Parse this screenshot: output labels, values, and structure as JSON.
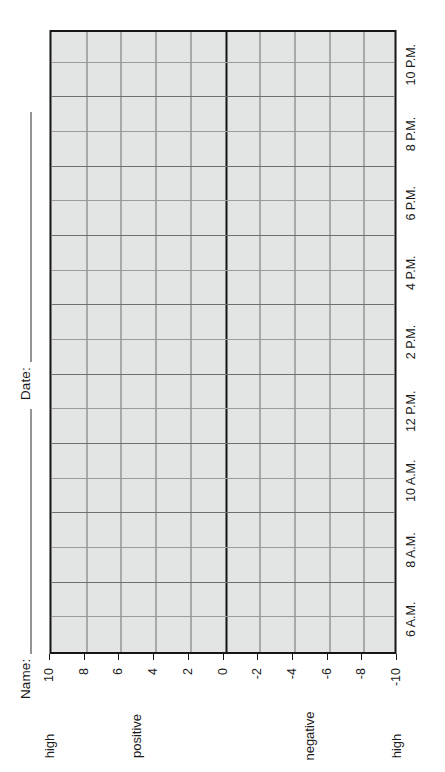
{
  "header": {
    "name_label": "Name:",
    "date_label": "Date:"
  },
  "chart_data": {
    "type": "table",
    "title": "",
    "subtitle": "",
    "xlabel": "",
    "ylabel": "",
    "grid": true,
    "legend": "none",
    "value_axis": {
      "label_positive": "positive",
      "label_negative": "negative",
      "high_label_top": "high",
      "high_label_bottom": "high",
      "ticks": [
        10,
        8,
        6,
        4,
        2,
        0,
        -2,
        -4,
        -6,
        -8,
        -10
      ],
      "tick_labels": [
        "10",
        "8",
        "6",
        "4",
        "2",
        "0",
        "-2",
        "-4",
        "-6",
        "-8",
        "-10"
      ],
      "range": [
        -10,
        10
      ],
      "zero_line": 0,
      "minor_step": 2
    },
    "time_axis": {
      "tick_labels": [
        "6 A.M.",
        "8 A.M.",
        "10 A.M.",
        "12 P.M.",
        "2 P.M.",
        "4 P.M.",
        "6 P.M.",
        "8 P.M.",
        "10 P.M."
      ],
      "range": [
        "6 A.M.",
        "11 P.M."
      ],
      "labelled_step_hours": 2,
      "subdivision_hours": 1,
      "columns": 18
    },
    "series": [],
    "values": []
  },
  "style": {
    "plot_fill": "#e3e4e4",
    "frame_color": "#161616",
    "grid_color": "#6d6f70",
    "minor_grid_color": "#9a9c9c",
    "page_background": "#ffffff",
    "text_color": "#1a1a1a"
  }
}
